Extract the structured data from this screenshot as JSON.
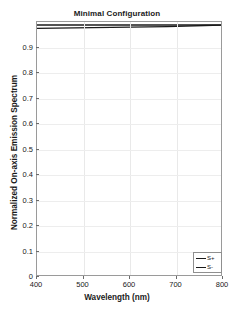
{
  "chart_data": {
    "type": "line",
    "title": "Minimal Configuration",
    "xlabel": "Wavelength (nm)",
    "ylabel": "Normalized On-axis Emission Spectrum",
    "xlim": [
      400,
      800
    ],
    "ylim": [
      0,
      1.0
    ],
    "grid": true,
    "legend_position": "lower-right",
    "xticks": [
      400,
      500,
      600,
      700,
      800
    ],
    "xtick_labels": [
      "400",
      "500",
      "600",
      "700",
      "800"
    ],
    "yticks": [
      0,
      0.1,
      0.2,
      0.3,
      0.4,
      0.5,
      0.6,
      0.7,
      0.8,
      0.9
    ],
    "ytick_labels": [
      "0",
      "0.1",
      "0.2",
      "0.3",
      "0.4",
      "0.5",
      "0.6",
      "0.7",
      "0.8",
      "0.9"
    ],
    "x": [
      400,
      440,
      480,
      520,
      560,
      600,
      640,
      680,
      720,
      760,
      800
    ],
    "series": [
      {
        "name": "S+",
        "color": "#1a1a1a",
        "values": [
          0.988,
          0.988,
          0.988,
          0.988,
          0.988,
          0.988,
          0.988,
          0.988,
          0.988,
          0.988,
          0.988
        ]
      },
      {
        "name": "S-",
        "color": "#1a1a1a",
        "values": [
          0.975,
          0.976,
          0.977,
          0.978,
          0.979,
          0.98,
          0.981,
          0.982,
          0.984,
          0.986,
          0.988
        ]
      }
    ]
  },
  "legend": {
    "entries": [
      {
        "label": "S+"
      },
      {
        "label": "S-"
      }
    ]
  }
}
